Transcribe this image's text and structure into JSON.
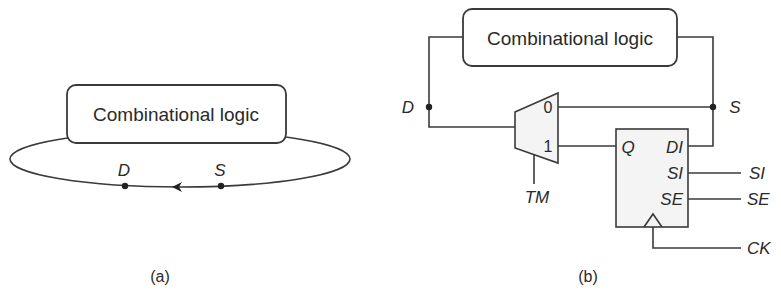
{
  "diagram_a": {
    "caption": "(a)",
    "block_label": "Combinational logic",
    "nodes": {
      "d_label": "D",
      "s_label": "S"
    },
    "flow_direction": "left"
  },
  "diagram_b": {
    "caption": "(b)",
    "block_label": "Combinational logic",
    "nodes": {
      "d_label": "D",
      "s_label": "S"
    },
    "mux": {
      "input_0": "0",
      "input_1": "1",
      "select_label": "TM"
    },
    "flip_flop": {
      "pins": {
        "q": "Q",
        "di": "DI",
        "si": "SI",
        "se": "SE"
      },
      "external_signals": {
        "si": "SI",
        "se": "SE",
        "ck": "CK"
      }
    }
  },
  "colors": {
    "line": "#3a3a3a",
    "text": "#2a2a2a",
    "ff_fill": "#f4f4f4",
    "background": "#ffffff"
  }
}
